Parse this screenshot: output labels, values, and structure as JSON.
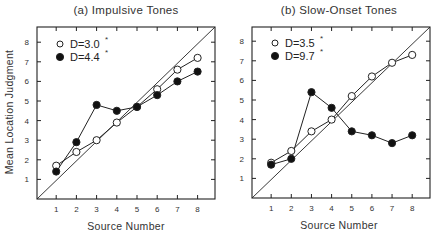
{
  "chart_data": [
    {
      "type": "line",
      "panel": "a",
      "title": "(a) Impulsive Tones",
      "xlabel": "Source Number",
      "ylabel": "Mean Location Judgment",
      "x": [
        1,
        2,
        3,
        4,
        5,
        6,
        7,
        8
      ],
      "xticks": [
        1,
        2,
        3,
        4,
        5,
        6,
        7,
        8
      ],
      "yticks": [
        1,
        2,
        3,
        4,
        5,
        6,
        7,
        8
      ],
      "xlim": [
        0,
        8.85
      ],
      "ylim": [
        0,
        8.8
      ],
      "grid": false,
      "diagonal_reference_line": true,
      "legend_position": "upper left",
      "series": [
        {
          "name": "D=3.0°",
          "label_main": "D=3.0",
          "marker": "open-circle",
          "values": [
            1.7,
            2.4,
            3.0,
            3.9,
            4.7,
            5.6,
            6.6,
            7.2
          ]
        },
        {
          "name": "D=4.4°",
          "label_main": "D=4.4",
          "marker": "filled-circle",
          "values": [
            1.4,
            2.9,
            4.8,
            4.5,
            4.7,
            5.3,
            6.0,
            6.5
          ]
        }
      ]
    },
    {
      "type": "line",
      "panel": "b",
      "title": "(b) Slow-Onset Tones",
      "xlabel": "Source Number",
      "ylabel": "",
      "x": [
        1,
        2,
        3,
        4,
        5,
        6,
        7,
        8
      ],
      "xticks": [
        1,
        2,
        3,
        4,
        5,
        6,
        7,
        8
      ],
      "yticks": [
        1,
        2,
        3,
        4,
        5,
        6,
        7,
        8
      ],
      "xlim": [
        0,
        8.85
      ],
      "ylim": [
        0,
        8.8
      ],
      "grid": false,
      "diagonal_reference_line": true,
      "legend_position": "upper left",
      "series": [
        {
          "name": "D=3.5°",
          "label_main": "D=3.5",
          "marker": "open-circle",
          "values": [
            1.8,
            2.4,
            3.4,
            4.0,
            5.2,
            6.2,
            6.9,
            7.3
          ]
        },
        {
          "name": "D=9.7°",
          "label_main": "D=9.7",
          "marker": "filled-circle",
          "values": [
            1.7,
            2.0,
            5.4,
            4.6,
            3.4,
            3.2,
            2.8,
            3.2
          ]
        }
      ]
    }
  ],
  "labels": {
    "ylabel": "Mean Location Judgment",
    "panel_a_title": "(a) Impulsive Tones",
    "panel_b_title": "(b) Slow-Onset Tones",
    "xlabel_a": "Source Number",
    "xlabel_b": "Source Number",
    "degree_mark": "°"
  },
  "colors": {
    "line": "#222222",
    "axis": "#222222",
    "open_fill": "#ffffff",
    "filled_fill": "#111111"
  }
}
